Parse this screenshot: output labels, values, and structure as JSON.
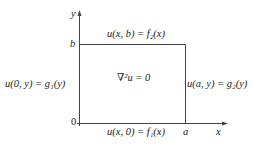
{
  "diagram": {
    "type": "dirichlet-rectangle",
    "axes": {
      "x_label": "x",
      "y_label": "y",
      "origin_label": "0"
    },
    "ticks": {
      "x_end": "a",
      "y_end": "b"
    },
    "boundary_conditions": {
      "top": "u(x, b) = f₂(x)",
      "bottom": "u(x, 0) = f₁(x)",
      "left": "u(0, y) = g₁(y)",
      "right": "u(a, y) = g₂(y)"
    },
    "interior_equation": "∇²u = 0",
    "colors": {
      "line": "#444444",
      "text": "#222222",
      "background": "#ffffff"
    }
  }
}
